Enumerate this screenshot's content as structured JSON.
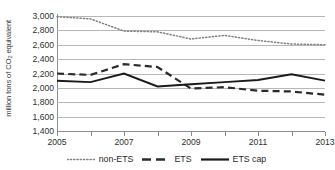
{
  "chart_data": {
    "type": "line",
    "title": "",
    "xlabel": "",
    "ylabel": "million tons of CO2 equivalent",
    "ylabel_parts": {
      "pre": "million tons of CO",
      "sub": "2",
      "post": " equivalent"
    },
    "x": [
      2005,
      2006,
      2007,
      2008,
      2009,
      2010,
      2011,
      2012,
      2013
    ],
    "xlim": [
      2005,
      2013
    ],
    "ylim": [
      1400,
      3000
    ],
    "grid": true,
    "legend_position": "bottom",
    "y_ticks": [
      "1,400",
      "1,600",
      "1,800",
      "2,000",
      "2,200",
      "2,400",
      "2,600",
      "2,800",
      "3,000"
    ],
    "y_tick_values": [
      1400,
      1600,
      1800,
      2000,
      2200,
      2400,
      2600,
      2800,
      3000
    ],
    "x_ticks": [
      "2005",
      "2007",
      "2009",
      "2011",
      "2013"
    ],
    "x_tick_values": [
      2005,
      2007,
      2009,
      2011,
      2013
    ],
    "x_minor_tick_values": [
      2006,
      2008,
      2010,
      2012
    ],
    "series": [
      {
        "name": "non-ETS",
        "style": "dotted",
        "color": "#808080",
        "values": [
          2990,
          2960,
          2790,
          2780,
          2680,
          2730,
          2660,
          2610,
          2600
        ]
      },
      {
        "name": "ETS",
        "style": "dashed",
        "color": "#2b2b2b",
        "values": [
          2200,
          2180,
          2330,
          2290,
          1990,
          2010,
          1960,
          1950,
          1905
        ]
      },
      {
        "name": "ETS cap",
        "style": "solid",
        "color": "#1a1a1a",
        "values": [
          2100,
          2080,
          2200,
          2020,
          2050,
          2080,
          2110,
          2190,
          2100
        ]
      }
    ]
  },
  "legend": {
    "items": [
      {
        "label": "non-ETS",
        "style": "dotted"
      },
      {
        "label": "ETS",
        "style": "dashed"
      },
      {
        "label": "ETS cap",
        "style": "solid"
      }
    ]
  },
  "colors": {
    "background": "#ffffff",
    "grid": "#b7b7b7",
    "axis": "#8d8d8d",
    "text": "#2f2f2f",
    "non_ets": "#808080",
    "ets": "#2b2b2b",
    "ets_cap": "#1a1a1a"
  }
}
